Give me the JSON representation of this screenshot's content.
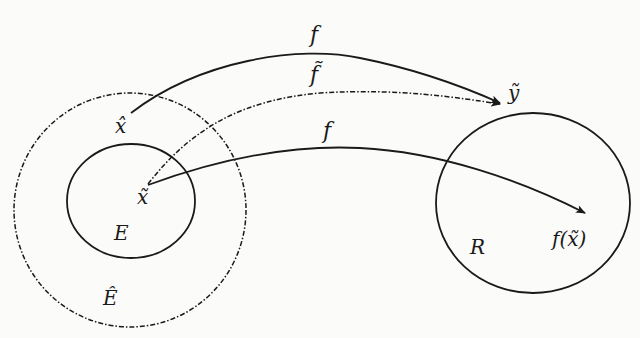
{
  "diagram": {
    "type": "function-mapping",
    "colors": {
      "ink": "#1a1a1a",
      "background": "#fbfbf9"
    },
    "sets": {
      "E": {
        "label": "E",
        "style": "solid"
      },
      "E_hat": {
        "label": "Ê",
        "style": "dash-dot"
      },
      "R": {
        "label": "R",
        "style": "solid"
      }
    },
    "points": {
      "x_hat": "x̂",
      "x_tilde": "x̃",
      "y_tilde": "ỹ",
      "f_x_tilde": "f(x̃)"
    },
    "arrows": [
      {
        "id": "f-upper",
        "label": "f",
        "from": "x̂",
        "to": "ỹ",
        "style": "solid"
      },
      {
        "id": "f-tilde",
        "label": "f̃",
        "from": "x̃",
        "to": "ỹ",
        "style": "dash-dot"
      },
      {
        "id": "f-lower",
        "label": "f",
        "from": "x̃",
        "to": "f(x̃)",
        "style": "solid"
      }
    ]
  }
}
